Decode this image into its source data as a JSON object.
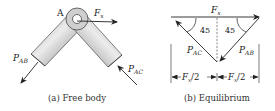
{
  "free_body": {
    "joint_label": "A",
    "force_x": {
      "base": "F",
      "sub": "x"
    },
    "force_ab": {
      "base": "P",
      "sub": "AB"
    },
    "force_ac": {
      "base": "P",
      "sub": "AC"
    },
    "caption": "(a) Free body"
  },
  "equilibrium": {
    "force_x": {
      "base": "F",
      "sub": "x"
    },
    "angle_left": "45",
    "angle_right": "45",
    "force_ac": {
      "base": "P",
      "sub": "AC"
    },
    "force_ab": {
      "base": "P",
      "sub": "AB"
    },
    "dim_left": {
      "base": "F",
      "sub": "x",
      "tail": "/2"
    },
    "dim_right": {
      "base": "F",
      "sub": "x",
      "tail": "/2"
    },
    "caption": "(b) Equilibrium"
  },
  "colors": {
    "line": "#222222",
    "tube_light": "#e6e6e6",
    "tube_dark": "#8a8a8a",
    "dash": "#555555"
  }
}
